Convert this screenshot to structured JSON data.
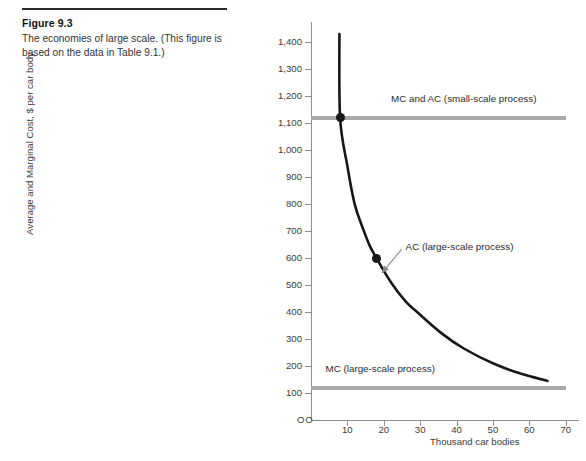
{
  "caption": {
    "number": "Figure 9.3",
    "text": "The economies of large scale. (This figure is based on the data in Table 9.1.)"
  },
  "chart_data": {
    "type": "line",
    "title": "The economies of large scale",
    "xlabel": "Thousand car bodies",
    "ylabel": "Average and Marginal Cost, $ per car body",
    "xlim": [
      0,
      72
    ],
    "ylim": [
      0,
      1460
    ],
    "grid": false,
    "legend": "inline-annotations",
    "x_ticks": [
      0,
      10,
      20,
      30,
      40,
      50,
      60,
      70
    ],
    "x_tick_labels": [
      "O",
      "10",
      "20",
      "30",
      "40",
      "50",
      "60",
      "70"
    ],
    "y_ticks": [
      0,
      100,
      200,
      300,
      400,
      500,
      600,
      700,
      800,
      900,
      1000,
      1100,
      1200,
      1300,
      1400
    ],
    "y_tick_labels": [
      "O",
      "100",
      "200",
      "300",
      "400",
      "500",
      "600",
      "700",
      "800",
      "900",
      "1,000",
      "1,100",
      "1,200",
      "1,300",
      "1,400"
    ],
    "series": [
      {
        "name": "AC (large-scale process)",
        "type": "curve",
        "color": "#171717",
        "points": [
          {
            "x": 7.8,
            "y": 1430
          },
          {
            "x": 8.0,
            "y": 1120
          },
          {
            "x": 10,
            "y": 940
          },
          {
            "x": 12,
            "y": 800
          },
          {
            "x": 14,
            "y": 720
          },
          {
            "x": 16,
            "y": 650
          },
          {
            "x": 18,
            "y": 600
          },
          {
            "x": 22,
            "y": 510
          },
          {
            "x": 26,
            "y": 440
          },
          {
            "x": 30,
            "y": 390
          },
          {
            "x": 36,
            "y": 320
          },
          {
            "x": 42,
            "y": 265
          },
          {
            "x": 50,
            "y": 210
          },
          {
            "x": 58,
            "y": 170
          },
          {
            "x": 65,
            "y": 145
          }
        ]
      },
      {
        "name": "MC and AC (small-scale process)",
        "type": "horizontal-line",
        "color": "#a8a8a8",
        "value": 1120,
        "x_start": 0,
        "x_end": 70
      },
      {
        "name": "MC (large-scale process)",
        "type": "horizontal-line",
        "color": "#a8a8a8",
        "value": 120,
        "x_start": 0,
        "x_end": 70
      }
    ],
    "markers": [
      {
        "x": 8,
        "y": 1120,
        "label": ""
      },
      {
        "x": 18,
        "y": 600,
        "label": ""
      }
    ],
    "annotations": [
      {
        "text": "MC and AC (small-scale process)",
        "x": 22,
        "y": 1190
      },
      {
        "text": "MC (large-scale process)",
        "x": 4,
        "y": 190
      },
      {
        "text": "AC (large-scale process)",
        "x": 26,
        "y": 640,
        "arrow_to": {
          "x": 19.5,
          "y": 545
        }
      }
    ]
  }
}
